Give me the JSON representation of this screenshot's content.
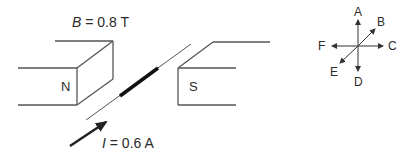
{
  "diagram": {
    "field_label_symbol": "B",
    "field_label_value": " = 0.8 T",
    "current_label_symbol": "I",
    "current_label_value": " = 0.6 A",
    "north_pole": "N",
    "south_pole": "S",
    "line_color": "#444444",
    "directions": {
      "A": "A",
      "B": "B",
      "C": "C",
      "D": "D",
      "E": "E",
      "F": "F"
    }
  }
}
